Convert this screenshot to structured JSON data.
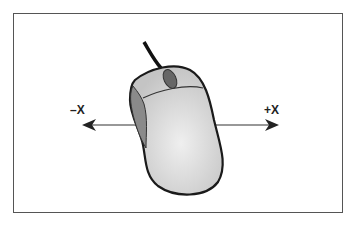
{
  "diagram": {
    "labels": {
      "negative_x": "–X",
      "positive_x": "+X"
    },
    "colors": {
      "outline": "#222222",
      "mouse_body": "#d9d9d9",
      "mouse_side": "#8a8a8a",
      "wheel": "#666666",
      "frame": "#555555"
    }
  }
}
